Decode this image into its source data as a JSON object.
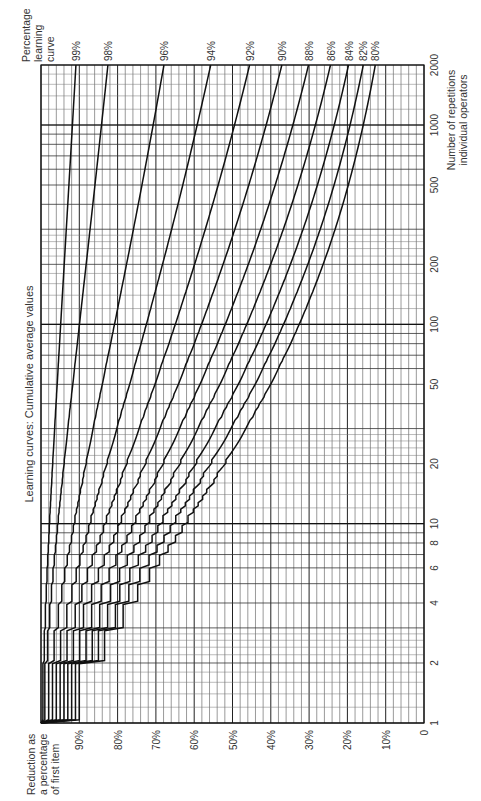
{
  "chart_data": {
    "type": "line",
    "title": "Learning curves: Cumulative average values",
    "xlabel": "Number of repetitions individual operators",
    "xlabel_lines": [
      "Number of repetitions",
      "individual operators"
    ],
    "ylabel": "Reduction as a percentage of first item",
    "ylabel_lines": [
      "Reduction as",
      "a percentage",
      "of first item"
    ],
    "legend_title": "Percentage learning curve",
    "legend_title_lines": [
      "Percentage",
      "learning",
      "curve"
    ],
    "x_scale": "log",
    "xlim": [
      1,
      2000
    ],
    "x_ticks": [
      1,
      2,
      4,
      6,
      8,
      10,
      20,
      50,
      100,
      200,
      500,
      1000,
      2000
    ],
    "x_tick_labels": [
      "1",
      "2",
      "4",
      "6",
      "8",
      "10",
      "20",
      "50",
      "100",
      "200",
      "500",
      "1000",
      "2000"
    ],
    "ylim": [
      0,
      100
    ],
    "y_ticks": [
      0,
      10,
      20,
      30,
      40,
      50,
      60,
      70,
      80,
      90
    ],
    "y_tick_labels": [
      "0",
      "10%",
      "20%",
      "30%",
      "40%",
      "50%",
      "60%",
      "70%",
      "80%",
      "90%"
    ],
    "grid": true,
    "orientation": "rotated 90° clockwise (repetitions axis runs bottom-to-top, percentage axis right-to-left)",
    "series": [
      {
        "name": "99%",
        "rate": 0.99,
        "x": [
          1,
          10,
          100,
          1000,
          2000
        ],
        "values": [
          100,
          97.3,
          94.1,
          90.9,
          89.9
        ]
      },
      {
        "name": "98%",
        "rate": 0.98,
        "x": [
          1,
          10,
          100,
          1000,
          2000
        ],
        "values": [
          100,
          94.7,
          88.6,
          82.7,
          81.0
        ]
      },
      {
        "name": "96%",
        "rate": 0.96,
        "x": [
          1,
          10,
          100,
          1000,
          2000
        ],
        "values": [
          100,
          89.8,
          78.7,
          68.7,
          66.0
        ]
      },
      {
        "name": "94%",
        "rate": 0.94,
        "x": [
          1,
          10,
          100,
          1000,
          2000
        ],
        "values": [
          100,
          85.3,
          70.1,
          57.4,
          54.0
        ]
      },
      {
        "name": "92%",
        "rate": 0.92,
        "x": [
          1,
          10,
          100,
          1000,
          2000
        ],
        "values": [
          100,
          81.0,
          62.6,
          48.1,
          44.2
        ]
      },
      {
        "name": "90%",
        "rate": 0.9,
        "x": [
          1,
          10,
          100,
          1000,
          2000
        ],
        "values": [
          100,
          77.0,
          56.0,
          40.4,
          36.3
        ]
      },
      {
        "name": "88%",
        "rate": 0.88,
        "x": [
          1,
          10,
          100,
          1000,
          2000
        ],
        "values": [
          100,
          73.2,
          50.1,
          33.9,
          29.8
        ]
      },
      {
        "name": "86%",
        "rate": 0.86,
        "x": [
          1,
          10,
          100,
          1000,
          2000
        ],
        "values": [
          100,
          69.6,
          44.9,
          28.5,
          24.5
        ]
      },
      {
        "name": "84%",
        "rate": 0.84,
        "x": [
          1,
          10,
          100,
          1000,
          2000
        ],
        "values": [
          100,
          66.2,
          40.3,
          24.0,
          20.1
        ]
      },
      {
        "name": "82%",
        "rate": 0.82,
        "x": [
          1,
          10,
          100,
          1000,
          2000
        ],
        "values": [
          100,
          63.0,
          36.2,
          20.2,
          16.5
        ]
      },
      {
        "name": "80%",
        "rate": 0.8,
        "x": [
          1,
          10,
          100,
          1000,
          2000
        ],
        "values": [
          100,
          59.9,
          32.5,
          17.0,
          13.6
        ]
      }
    ]
  }
}
